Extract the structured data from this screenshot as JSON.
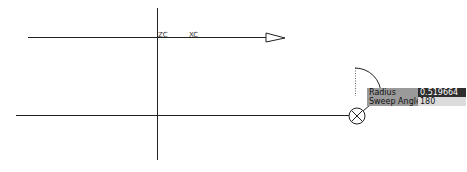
{
  "viewport": {
    "axis_labels": {
      "zc": "ZC",
      "xc": "XC"
    }
  },
  "dynamic_input": {
    "radius": {
      "label": "Radius",
      "value": "0.519664"
    },
    "sweep_angle": {
      "label": "Sweep Angle",
      "value": "180"
    }
  },
  "colors": {
    "line": "#222222",
    "label_bg": "#9a9a9a",
    "active_value_bg": "#2e2e2e",
    "inactive_value_bg": "#dcdcdc"
  }
}
